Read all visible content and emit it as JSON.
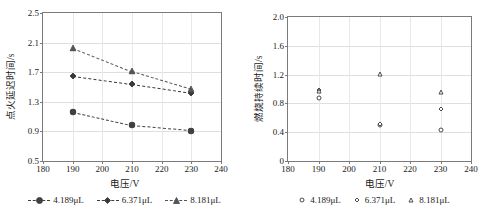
{
  "figure": {
    "panels": [
      {
        "name": "ignition-delay-chart",
        "xaxis_title": "电压/V",
        "yaxis_title": "点火延迟时间/s"
      },
      {
        "name": "combustion-duration-chart",
        "xaxis_title": "电压/V",
        "yaxis_title": "燃烧持续时间/s"
      }
    ]
  },
  "chart_data": [
    {
      "type": "line",
      "name": "ignition-delay",
      "title": "",
      "xlabel": "电压/V",
      "ylabel": "点火延迟时间/s",
      "xlim": [
        180,
        240
      ],
      "ylim": [
        0.5,
        2.5
      ],
      "xticks": [
        180,
        190,
        200,
        210,
        220,
        230,
        240
      ],
      "xticklabels": [
        "180",
        "190",
        "200",
        "210",
        "220",
        "230",
        "240"
      ],
      "yticks": [
        0.5,
        0.9,
        1.3,
        1.7,
        2.1,
        2.5
      ],
      "yticklabels": [
        "0.5",
        "0.9",
        "1.3",
        "1.7",
        "2.1",
        "2.5"
      ],
      "grid": true,
      "legend_position": "bottom",
      "linestyle": "dashed",
      "marker_fill": "filled",
      "x": [
        190,
        210,
        230
      ],
      "series": [
        {
          "name": "4.189μL",
          "marker": "circle",
          "color": "#404040",
          "values": [
            1.16,
            0.98,
            0.91
          ]
        },
        {
          "name": "6.371μL",
          "marker": "diamond",
          "color": "#3a3a3a",
          "values": [
            1.65,
            1.54,
            1.42
          ]
        },
        {
          "name": "8.181μL",
          "marker": "triangle",
          "color": "#555555",
          "values": [
            2.03,
            1.71,
            1.47
          ]
        }
      ]
    },
    {
      "type": "scatter",
      "name": "combustion-duration",
      "title": "",
      "xlabel": "电压/V",
      "ylabel": "燃烧持续时间/s",
      "xlim": [
        180,
        240
      ],
      "ylim": [
        0,
        2.0
      ],
      "xticks": [
        180,
        190,
        200,
        210,
        220,
        230,
        240
      ],
      "xticklabels": [
        "180",
        "190",
        "200",
        "210",
        "220",
        "230",
        "240"
      ],
      "yticks": [
        0,
        0.4,
        0.8,
        1.2,
        1.6,
        2.0
      ],
      "yticklabels": [
        "0",
        "0.4",
        "0.8",
        "1.2",
        "1.6",
        "2.0"
      ],
      "grid": true,
      "legend_position": "bottom",
      "linestyle": "none",
      "marker_fill": "open",
      "x": [
        190,
        210,
        230
      ],
      "series": [
        {
          "name": "4.189μL",
          "marker": "circle",
          "color": "#4a4a4a",
          "values": [
            0.87,
            0.5,
            0.43
          ]
        },
        {
          "name": "6.371μL",
          "marker": "diamond",
          "color": "#4a4a4a",
          "values": [
            0.98,
            0.52,
            0.72
          ]
        },
        {
          "name": "8.181μL",
          "marker": "triangle",
          "color": "#4a4a4a",
          "values": [
            0.97,
            1.21,
            0.96
          ]
        }
      ]
    }
  ]
}
